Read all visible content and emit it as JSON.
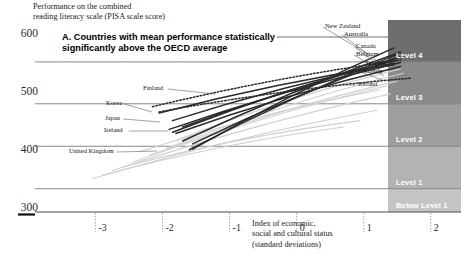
{
  "header": {
    "y_axis_caption": "Performance on the combined\nreading literacy scale (PISA scale score)"
  },
  "panel": {
    "title": "A. Countries with mean performance statistically significantly above the OECD average"
  },
  "chart_data": {
    "type": "line",
    "title": "A. Countries with mean performance statistically significantly above the OECD average",
    "ylabel": "Performance on the combined reading literacy scale (PISA scale score)",
    "xlabel": "Index of economic, social and cultural status (standard deviations)",
    "xlim": [
      -3.9,
      2.45
    ],
    "ylim": [
      295,
      625
    ],
    "yticks": [
      600,
      500,
      400,
      300
    ],
    "xticks": [
      -3,
      -2,
      -1,
      0,
      1,
      2
    ],
    "grid": true,
    "legend": "inline-labels",
    "proficiency_bands": [
      {
        "label": "Level 5",
        "score_min": 625,
        "score_max": 698,
        "color": "#595959"
      },
      {
        "label": "Level 4",
        "score_min": 553,
        "score_max": 625,
        "color": "#6e6e6e"
      },
      {
        "label": "Level 3",
        "score_min": 481,
        "score_max": 553,
        "color": "#8a8a8a"
      },
      {
        "label": "Level 2",
        "score_min": 408,
        "score_max": 481,
        "color": "#9e9e9e"
      },
      {
        "label": "Level 1",
        "score_min": 335,
        "score_max": 408,
        "color": "#b3b3b3"
      },
      {
        "label": "Below Level 1",
        "score_min": 295,
        "score_max": 335,
        "color": "#c4c4c4"
      }
    ],
    "series": [
      {
        "name": "New Zealand",
        "style": "solid-dark",
        "x": [
          -1.55,
          1.45
        ],
        "y": [
          403,
          577
        ]
      },
      {
        "name": "Australia",
        "style": "solid-dark",
        "x": [
          -1.7,
          1.55
        ],
        "y": [
          417,
          570
        ]
      },
      {
        "name": "Canada",
        "style": "solid-dark",
        "x": [
          -1.85,
          1.6
        ],
        "y": [
          432,
          563
        ]
      },
      {
        "name": "Belgium",
        "style": "solid-dark",
        "x": [
          -1.55,
          1.5
        ],
        "y": [
          412,
          560
        ]
      },
      {
        "name": "Sweden",
        "style": "solid-dark",
        "x": [
          -1.9,
          1.55
        ],
        "y": [
          437,
          552
        ]
      },
      {
        "name": "Austria",
        "style": "solid-dark",
        "x": [
          -1.8,
          1.55
        ],
        "y": [
          430,
          545
        ]
      },
      {
        "name": "Finland",
        "style": "dotted",
        "x": [
          -2.15,
          1.55
        ],
        "y": [
          476,
          556
        ]
      },
      {
        "name": "Korea",
        "style": "solid-dark",
        "x": [
          -2.05,
          1.45
        ],
        "y": [
          465,
          548
        ]
      },
      {
        "name": "Japan",
        "style": "solid-dark",
        "x": [
          -1.85,
          1.45
        ],
        "y": [
          452,
          551
        ]
      },
      {
        "name": "Ireland",
        "style": "solid-dark",
        "x": [
          -1.7,
          1.5
        ],
        "y": [
          441,
          556
        ]
      },
      {
        "name": "United Kingdom",
        "style": "solid-dark",
        "x": [
          -1.6,
          1.5
        ],
        "y": [
          402,
          566
        ]
      },
      {
        "name": "Iceland",
        "style": "dotted",
        "x": [
          -2.05,
          1.7
        ],
        "y": [
          467,
          525
        ]
      }
    ],
    "background_series_count": 9,
    "labelled_countries": [
      "New Zealand",
      "Australia",
      "Canada",
      "Belgium",
      "Sweden",
      "Austria",
      "Iceland",
      "Finland",
      "Korea",
      "Japan",
      "Ireland",
      "United Kingdom"
    ]
  },
  "axis": {
    "x_caption": "Index of economic,\nsocial and cultural status\n(standard deviations)",
    "yticks": [
      "600",
      "500",
      "400",
      "300"
    ],
    "xticks": [
      "-3",
      "-2",
      "-1",
      "0",
      "1",
      "2"
    ]
  },
  "colors": {
    "line_dark": "#2b2b2b",
    "line_faint": "#cfcfcf",
    "grid": "#7a7a7a",
    "band_level5": "#595959",
    "band_level4": "#6e6e6e",
    "band_level3": "#8a8a8a",
    "band_level2": "#9e9e9e",
    "band_level1": "#b3b3b3",
    "band_below1": "#c4c4c4"
  }
}
